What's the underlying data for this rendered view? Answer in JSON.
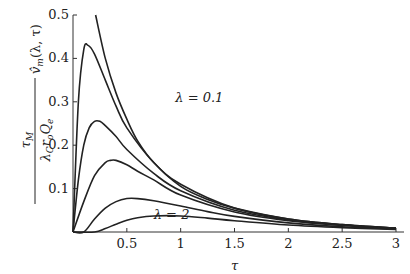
{
  "chart_data": {
    "type": "line",
    "title": "",
    "xlabel": "τ",
    "ylabel": "τ_M / (λ_C r_o Q_e) · v̂_m(λ, τ)",
    "xlim": [
      0,
      3
    ],
    "ylim": [
      0,
      0.5
    ],
    "x_ticks": [
      "0.5",
      "1",
      "1.5",
      "2",
      "2.5",
      "3"
    ],
    "y_ticks": [
      "0.1",
      "0.2",
      "0.3",
      "0.4",
      "0.5"
    ],
    "grid": false,
    "legend": "none",
    "annotations": [
      {
        "text": "λ = 0.1",
        "x": 0.95,
        "y": 0.3
      },
      {
        "text": "λ = 2",
        "x": 0.75,
        "y": 0.03
      }
    ],
    "series": [
      {
        "name": "λ = 0.1",
        "x": [
          0.21,
          0.3,
          0.4,
          0.5,
          0.6,
          0.75,
          1.0,
          1.25,
          1.5,
          2.0,
          2.5,
          3.0
        ],
        "values": [
          0.5,
          0.4,
          0.32,
          0.26,
          0.21,
          0.16,
          0.105,
          0.075,
          0.055,
          0.03,
          0.017,
          0.009
        ]
      },
      {
        "name": "λ = 0.25",
        "x": [
          0.0,
          0.05,
          0.1,
          0.14,
          0.2,
          0.3,
          0.4,
          0.5,
          0.75,
          1.0,
          1.5,
          2.0,
          2.5,
          3.0
        ],
        "values": [
          0.0,
          0.3,
          0.42,
          0.43,
          0.41,
          0.35,
          0.29,
          0.24,
          0.16,
          0.11,
          0.055,
          0.03,
          0.017,
          0.009
        ]
      },
      {
        "name": "λ = 0.5",
        "x": [
          0.0,
          0.05,
          0.1,
          0.15,
          0.2,
          0.25,
          0.3,
          0.4,
          0.5,
          0.75,
          1.0,
          1.5,
          2.0,
          2.5,
          3.0
        ],
        "values": [
          0.0,
          0.12,
          0.2,
          0.24,
          0.255,
          0.255,
          0.245,
          0.22,
          0.19,
          0.135,
          0.095,
          0.05,
          0.028,
          0.016,
          0.009
        ]
      },
      {
        "name": "λ = 0.75",
        "x": [
          0.0,
          0.1,
          0.2,
          0.3,
          0.35,
          0.4,
          0.5,
          0.6,
          0.75,
          1.0,
          1.5,
          2.0,
          2.5,
          3.0
        ],
        "values": [
          0.0,
          0.07,
          0.13,
          0.16,
          0.165,
          0.165,
          0.155,
          0.14,
          0.12,
          0.085,
          0.046,
          0.026,
          0.015,
          0.008
        ]
      },
      {
        "name": "λ = 1",
        "x": [
          0.0,
          0.1,
          0.2,
          0.3,
          0.4,
          0.5,
          0.6,
          0.75,
          1.0,
          1.25,
          1.5,
          2.0,
          2.5,
          3.0
        ],
        "values": [
          0.0,
          0.0,
          0.03,
          0.055,
          0.07,
          0.077,
          0.077,
          0.072,
          0.06,
          0.047,
          0.036,
          0.021,
          0.012,
          0.007
        ]
      },
      {
        "name": "λ = 2",
        "x": [
          0.0,
          0.2,
          0.3,
          0.4,
          0.5,
          0.6,
          0.75,
          1.0,
          1.25,
          1.5,
          2.0,
          2.5,
          3.0
        ],
        "values": [
          0.0,
          0.0,
          0.008,
          0.018,
          0.027,
          0.033,
          0.037,
          0.037,
          0.032,
          0.026,
          0.016,
          0.01,
          0.006
        ]
      }
    ]
  }
}
